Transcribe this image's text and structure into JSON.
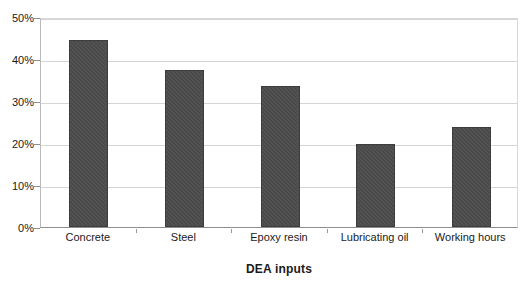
{
  "chart_data": {
    "type": "bar",
    "title": "",
    "xlabel": "DEA inputs",
    "ylabel": "",
    "categories": [
      "Concrete",
      "Steel",
      "Epoxy resin",
      "Lubricating oil",
      "Working hours"
    ],
    "values": [
      44.5,
      37.5,
      33.5,
      19.8,
      23.8
    ],
    "ylim": [
      0,
      50
    ],
    "ytick_labels": [
      "0%",
      "10%",
      "20%",
      "30%",
      "40%",
      "50%"
    ],
    "ytick_values": [
      0,
      10,
      20,
      30,
      40,
      50
    ],
    "grid": true,
    "legend": "none",
    "value_format": "percent",
    "bar_color": "#4a4a4a",
    "gridline_color": "#d5d5d5",
    "axis_color": "#8f8f8f",
    "background_color": "#ffffff"
  }
}
